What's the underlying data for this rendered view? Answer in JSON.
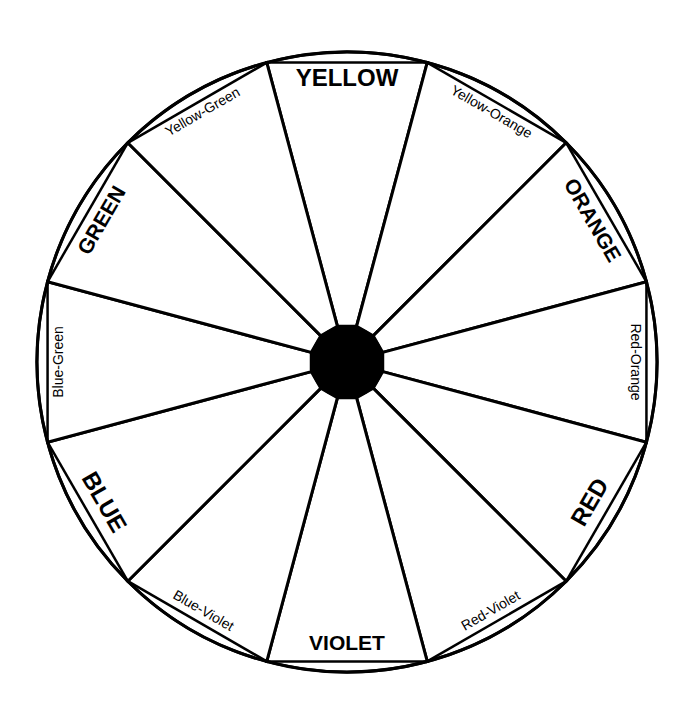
{
  "diagram": {
    "type": "color-wheel",
    "segment_count": 12,
    "colors": {
      "line": "#000000",
      "hub": "#000000",
      "background": "#ffffff",
      "segment_fill": "#ffffff"
    },
    "segments": [
      {
        "label": "YELLOW",
        "tier": "primary"
      },
      {
        "label": "Yellow-Orange",
        "tier": "tertiary"
      },
      {
        "label": "ORANGE",
        "tier": "secondary"
      },
      {
        "label": "Red-Orange",
        "tier": "tertiary"
      },
      {
        "label": "RED",
        "tier": "primary"
      },
      {
        "label": "Red-Violet",
        "tier": "tertiary"
      },
      {
        "label": "VIOLET",
        "tier": "secondary"
      },
      {
        "label": "Blue-Violet",
        "tier": "tertiary"
      },
      {
        "label": "BLUE",
        "tier": "primary"
      },
      {
        "label": "Blue-Green",
        "tier": "tertiary"
      },
      {
        "label": "GREEN",
        "tier": "secondary"
      },
      {
        "label": "Yellow-Green",
        "tier": "tertiary"
      }
    ]
  }
}
